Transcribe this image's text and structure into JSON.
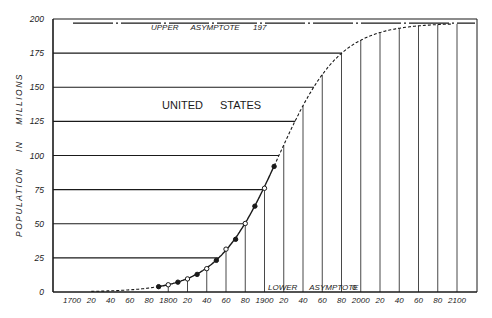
{
  "chart_data": {
    "type": "line",
    "title": "",
    "annotation_main": "UNITED STATES",
    "ylabel": "POPULATION IN MILLIONS",
    "xlabel": "",
    "ylim": [
      0,
      200
    ],
    "xlim": [
      1690,
      2120
    ],
    "y_ticks": [
      0,
      25,
      50,
      75,
      100,
      125,
      150,
      175,
      200
    ],
    "y_tick_labels": [
      "0",
      "25",
      "50",
      "75",
      "100",
      "125",
      "150",
      "175",
      "200"
    ],
    "x_ticks": [
      1700,
      1720,
      1740,
      1760,
      1780,
      1800,
      1820,
      1840,
      1860,
      1880,
      1900,
      1920,
      1940,
      1960,
      1980,
      2000,
      2020,
      2040,
      2060,
      2080,
      2100
    ],
    "x_tick_labels": [
      "1700",
      "20",
      "40",
      "60",
      "80",
      "1800",
      "20",
      "40",
      "60",
      "80",
      "1900",
      "20",
      "40",
      "60",
      "80",
      "2000",
      "20",
      "40",
      "60",
      "80",
      "2100"
    ],
    "upper_asymptote": {
      "label": "UPPER ASYMPTOTE",
      "value": 197,
      "value_label": "197"
    },
    "lower_asymptote": {
      "label": "LOWER ASYMPTOTE",
      "value": 0,
      "value_label": "0"
    },
    "logistic_fit": {
      "K": 197,
      "midpoint_year": 1914,
      "rate": 0.0313
    },
    "series": [
      {
        "name": "Census population",
        "x": [
          1790,
          1800,
          1810,
          1820,
          1830,
          1840,
          1850,
          1860,
          1870,
          1880,
          1890,
          1900,
          1910
        ],
        "values": [
          3.9,
          5.3,
          7.2,
          9.6,
          12.9,
          17.1,
          23.2,
          31.4,
          38.6,
          50.2,
          62.9,
          76.0,
          92.0
        ]
      }
    ],
    "grid": true,
    "legend": "none"
  }
}
